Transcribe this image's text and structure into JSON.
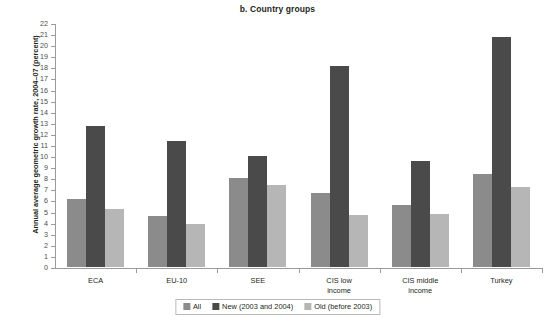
{
  "chart_data": {
    "type": "bar",
    "title": "b. Country groups",
    "xlabel": "",
    "ylabel": "Annual average geometric growth rate, 2004–07 (percent)",
    "ylim": [
      0,
      22
    ],
    "ytick_step": 1,
    "grid": false,
    "legend_position": "bottom",
    "categories": [
      "ECA",
      "EU-10",
      "SEE",
      "CIS low income",
      "CIS middle income",
      "Turkey"
    ],
    "category_lines": [
      [
        "ECA"
      ],
      [
        "EU-10"
      ],
      [
        "SEE"
      ],
      [
        "CIS low",
        "income"
      ],
      [
        "CIS middle",
        "income"
      ],
      [
        "Turkey"
      ]
    ],
    "yticks": [
      0,
      1,
      2,
      3,
      4,
      5,
      6,
      7,
      8,
      9,
      10,
      11,
      12,
      13,
      14,
      15,
      16,
      17,
      18,
      19,
      20,
      21,
      22
    ],
    "series": [
      {
        "name": "All",
        "color": "#8b8b8b",
        "values": [
          6.1,
          4.6,
          8.0,
          6.7,
          5.6,
          8.4
        ]
      },
      {
        "name": "New (2003 and 2004)",
        "color": "#4a4a4a",
        "values": [
          12.7,
          11.4,
          10.0,
          18.1,
          9.6,
          20.7
        ]
      },
      {
        "name": "Old (before 2003)",
        "color": "#b6b6b6",
        "values": [
          5.2,
          3.9,
          7.4,
          4.7,
          4.8,
          7.2
        ]
      }
    ]
  },
  "legend": {
    "items": [
      {
        "label": "All",
        "color": "#8b8b8b"
      },
      {
        "label": "New (2003 and 2004)",
        "color": "#4a4a4a"
      },
      {
        "label": "Old (before 2003)",
        "color": "#b6b6b6"
      }
    ]
  }
}
